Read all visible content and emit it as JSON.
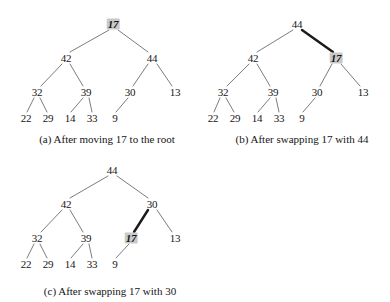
{
  "figure": {
    "background_color": "#ffffff",
    "edge_color": "#5a5a5a",
    "bold_edge_color": "#1a1a1a",
    "highlight_color": "#c9c9c9",
    "text_color": "#161616"
  },
  "panels": [
    {
      "id": "a",
      "caption": "(a) After moving 17 to the root",
      "caption_x": 107,
      "caption_y": 134,
      "nodes": [
        {
          "label": "17",
          "x": 113,
          "y": 24,
          "highlight": true
        },
        {
          "label": "42",
          "x": 66,
          "y": 58,
          "highlight": false
        },
        {
          "label": "44",
          "x": 152,
          "y": 58,
          "highlight": false
        },
        {
          "label": "32",
          "x": 37,
          "y": 92,
          "highlight": false
        },
        {
          "label": "39",
          "x": 86,
          "y": 92,
          "highlight": false
        },
        {
          "label": "30",
          "x": 130,
          "y": 92,
          "highlight": false
        },
        {
          "label": "13",
          "x": 175,
          "y": 92,
          "highlight": false
        },
        {
          "label": "22",
          "x": 26,
          "y": 118,
          "highlight": false
        },
        {
          "label": "29",
          "x": 48,
          "y": 118,
          "highlight": false
        },
        {
          "label": "14",
          "x": 70,
          "y": 118,
          "highlight": false
        },
        {
          "label": "33",
          "x": 92,
          "y": 118,
          "highlight": false
        },
        {
          "label": "9",
          "x": 115,
          "y": 118,
          "highlight": false
        }
      ],
      "edges": [
        {
          "x1": 109,
          "y1": 30,
          "x2": 70,
          "y2": 52,
          "bold": false
        },
        {
          "x1": 118,
          "y1": 30,
          "x2": 148,
          "y2": 52,
          "bold": false
        },
        {
          "x1": 62,
          "y1": 64,
          "x2": 41,
          "y2": 86,
          "bold": false
        },
        {
          "x1": 70,
          "y1": 64,
          "x2": 83,
          "y2": 86,
          "bold": false
        },
        {
          "x1": 148,
          "y1": 64,
          "x2": 133,
          "y2": 86,
          "bold": false
        },
        {
          "x1": 157,
          "y1": 64,
          "x2": 172,
          "y2": 86,
          "bold": false
        },
        {
          "x1": 34,
          "y1": 98,
          "x2": 27,
          "y2": 112,
          "bold": false
        },
        {
          "x1": 40,
          "y1": 98,
          "x2": 47,
          "y2": 112,
          "bold": false
        },
        {
          "x1": 83,
          "y1": 98,
          "x2": 71,
          "y2": 112,
          "bold": false
        },
        {
          "x1": 89,
          "y1": 98,
          "x2": 92,
          "y2": 112,
          "bold": false
        },
        {
          "x1": 128,
          "y1": 98,
          "x2": 116,
          "y2": 112,
          "bold": false
        }
      ]
    },
    {
      "id": "b",
      "caption": "(b) After swapping 17 with 44",
      "caption_x": 107,
      "caption_y": 134,
      "nodes": [
        {
          "label": "44",
          "x": 102,
          "y": 24,
          "highlight": false
        },
        {
          "label": "42",
          "x": 58,
          "y": 58,
          "highlight": false
        },
        {
          "label": "17",
          "x": 141,
          "y": 58,
          "highlight": true
        },
        {
          "label": "32",
          "x": 28,
          "y": 92,
          "highlight": false
        },
        {
          "label": "39",
          "x": 78,
          "y": 92,
          "highlight": false
        },
        {
          "label": "30",
          "x": 122,
          "y": 92,
          "highlight": false
        },
        {
          "label": "13",
          "x": 168,
          "y": 92,
          "highlight": false
        },
        {
          "label": "22",
          "x": 18,
          "y": 118,
          "highlight": false
        },
        {
          "label": "29",
          "x": 40,
          "y": 118,
          "highlight": false
        },
        {
          "label": "14",
          "x": 62,
          "y": 118,
          "highlight": false
        },
        {
          "label": "33",
          "x": 84,
          "y": 118,
          "highlight": false
        },
        {
          "label": "9",
          "x": 107,
          "y": 118,
          "highlight": false
        }
      ],
      "edges": [
        {
          "x1": 98,
          "y1": 30,
          "x2": 62,
          "y2": 52,
          "bold": false
        },
        {
          "x1": 107,
          "y1": 30,
          "x2": 138,
          "y2": 52,
          "bold": true
        },
        {
          "x1": 54,
          "y1": 64,
          "x2": 32,
          "y2": 86,
          "bold": false
        },
        {
          "x1": 62,
          "y1": 64,
          "x2": 75,
          "y2": 86,
          "bold": false
        },
        {
          "x1": 137,
          "y1": 64,
          "x2": 125,
          "y2": 86,
          "bold": false
        },
        {
          "x1": 146,
          "y1": 64,
          "x2": 165,
          "y2": 86,
          "bold": false
        },
        {
          "x1": 25,
          "y1": 98,
          "x2": 19,
          "y2": 112,
          "bold": false
        },
        {
          "x1": 31,
          "y1": 98,
          "x2": 39,
          "y2": 112,
          "bold": false
        },
        {
          "x1": 75,
          "y1": 98,
          "x2": 63,
          "y2": 112,
          "bold": false
        },
        {
          "x1": 81,
          "y1": 98,
          "x2": 84,
          "y2": 112,
          "bold": false
        },
        {
          "x1": 120,
          "y1": 98,
          "x2": 108,
          "y2": 112,
          "bold": false
        }
      ]
    },
    {
      "id": "c",
      "caption": "(c) After swapping 17 with 30",
      "caption_x": 110,
      "caption_y": 134,
      "nodes": [
        {
          "label": "44",
          "x": 112,
          "y": 18,
          "highlight": false
        },
        {
          "label": "42",
          "x": 66,
          "y": 52,
          "highlight": false
        },
        {
          "label": "30",
          "x": 152,
          "y": 52,
          "highlight": false
        },
        {
          "label": "32",
          "x": 37,
          "y": 86,
          "highlight": false
        },
        {
          "label": "39",
          "x": 86,
          "y": 86,
          "highlight": false
        },
        {
          "label": "17",
          "x": 131,
          "y": 86,
          "highlight": true
        },
        {
          "label": "13",
          "x": 175,
          "y": 86,
          "highlight": false
        },
        {
          "label": "22",
          "x": 26,
          "y": 112,
          "highlight": false
        },
        {
          "label": "29",
          "x": 48,
          "y": 112,
          "highlight": false
        },
        {
          "label": "14",
          "x": 70,
          "y": 112,
          "highlight": false
        },
        {
          "label": "33",
          "x": 92,
          "y": 112,
          "highlight": false
        },
        {
          "label": "9",
          "x": 115,
          "y": 112,
          "highlight": false
        }
      ],
      "edges": [
        {
          "x1": 108,
          "y1": 24,
          "x2": 70,
          "y2": 46,
          "bold": false
        },
        {
          "x1": 117,
          "y1": 24,
          "x2": 148,
          "y2": 46,
          "bold": false
        },
        {
          "x1": 62,
          "y1": 58,
          "x2": 41,
          "y2": 80,
          "bold": false
        },
        {
          "x1": 70,
          "y1": 58,
          "x2": 83,
          "y2": 80,
          "bold": false
        },
        {
          "x1": 148,
          "y1": 58,
          "x2": 134,
          "y2": 80,
          "bold": true
        },
        {
          "x1": 157,
          "y1": 58,
          "x2": 172,
          "y2": 80,
          "bold": false
        },
        {
          "x1": 34,
          "y1": 92,
          "x2": 27,
          "y2": 106,
          "bold": false
        },
        {
          "x1": 40,
          "y1": 92,
          "x2": 47,
          "y2": 106,
          "bold": false
        },
        {
          "x1": 83,
          "y1": 92,
          "x2": 71,
          "y2": 106,
          "bold": false
        },
        {
          "x1": 89,
          "y1": 92,
          "x2": 92,
          "y2": 106,
          "bold": false
        },
        {
          "x1": 129,
          "y1": 92,
          "x2": 116,
          "y2": 106,
          "bold": false
        }
      ]
    }
  ]
}
